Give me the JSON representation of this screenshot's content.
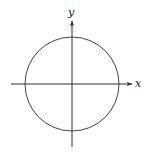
{
  "diagram": {
    "colors": {
      "stroke": "#333333",
      "background": "#ffffff"
    },
    "labels": {
      "x_axis": "x",
      "y_axis": "y"
    },
    "geometry": {
      "origin": [
        72,
        84
      ],
      "circle_radius": 47,
      "x_axis": {
        "from": [
          11,
          84
        ],
        "to": [
          132,
          84
        ]
      },
      "y_axis": {
        "from": [
          72,
          147
        ],
        "to": [
          72,
          21
        ]
      }
    }
  }
}
